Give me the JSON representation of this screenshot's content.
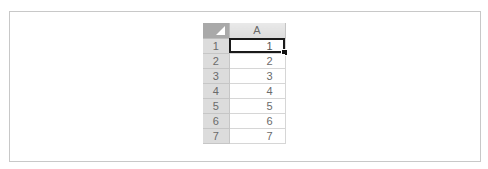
{
  "sheet": {
    "corner_icon": "select-all-triangle-icon",
    "columns": [
      "A"
    ],
    "rows": [
      {
        "header": "1",
        "A": "1"
      },
      {
        "header": "2",
        "A": "2"
      },
      {
        "header": "3",
        "A": "3"
      },
      {
        "header": "4",
        "A": "4"
      },
      {
        "header": "5",
        "A": "5"
      },
      {
        "header": "6",
        "A": "6"
      },
      {
        "header": "7",
        "A": "7"
      }
    ],
    "selected_cell": "A1"
  },
  "colors": {
    "header_bg": "#dcdcdc",
    "corner_bg": "#a9a9a9",
    "selection_border": "#1a1a1a",
    "frame_border": "#c8c8c8"
  }
}
